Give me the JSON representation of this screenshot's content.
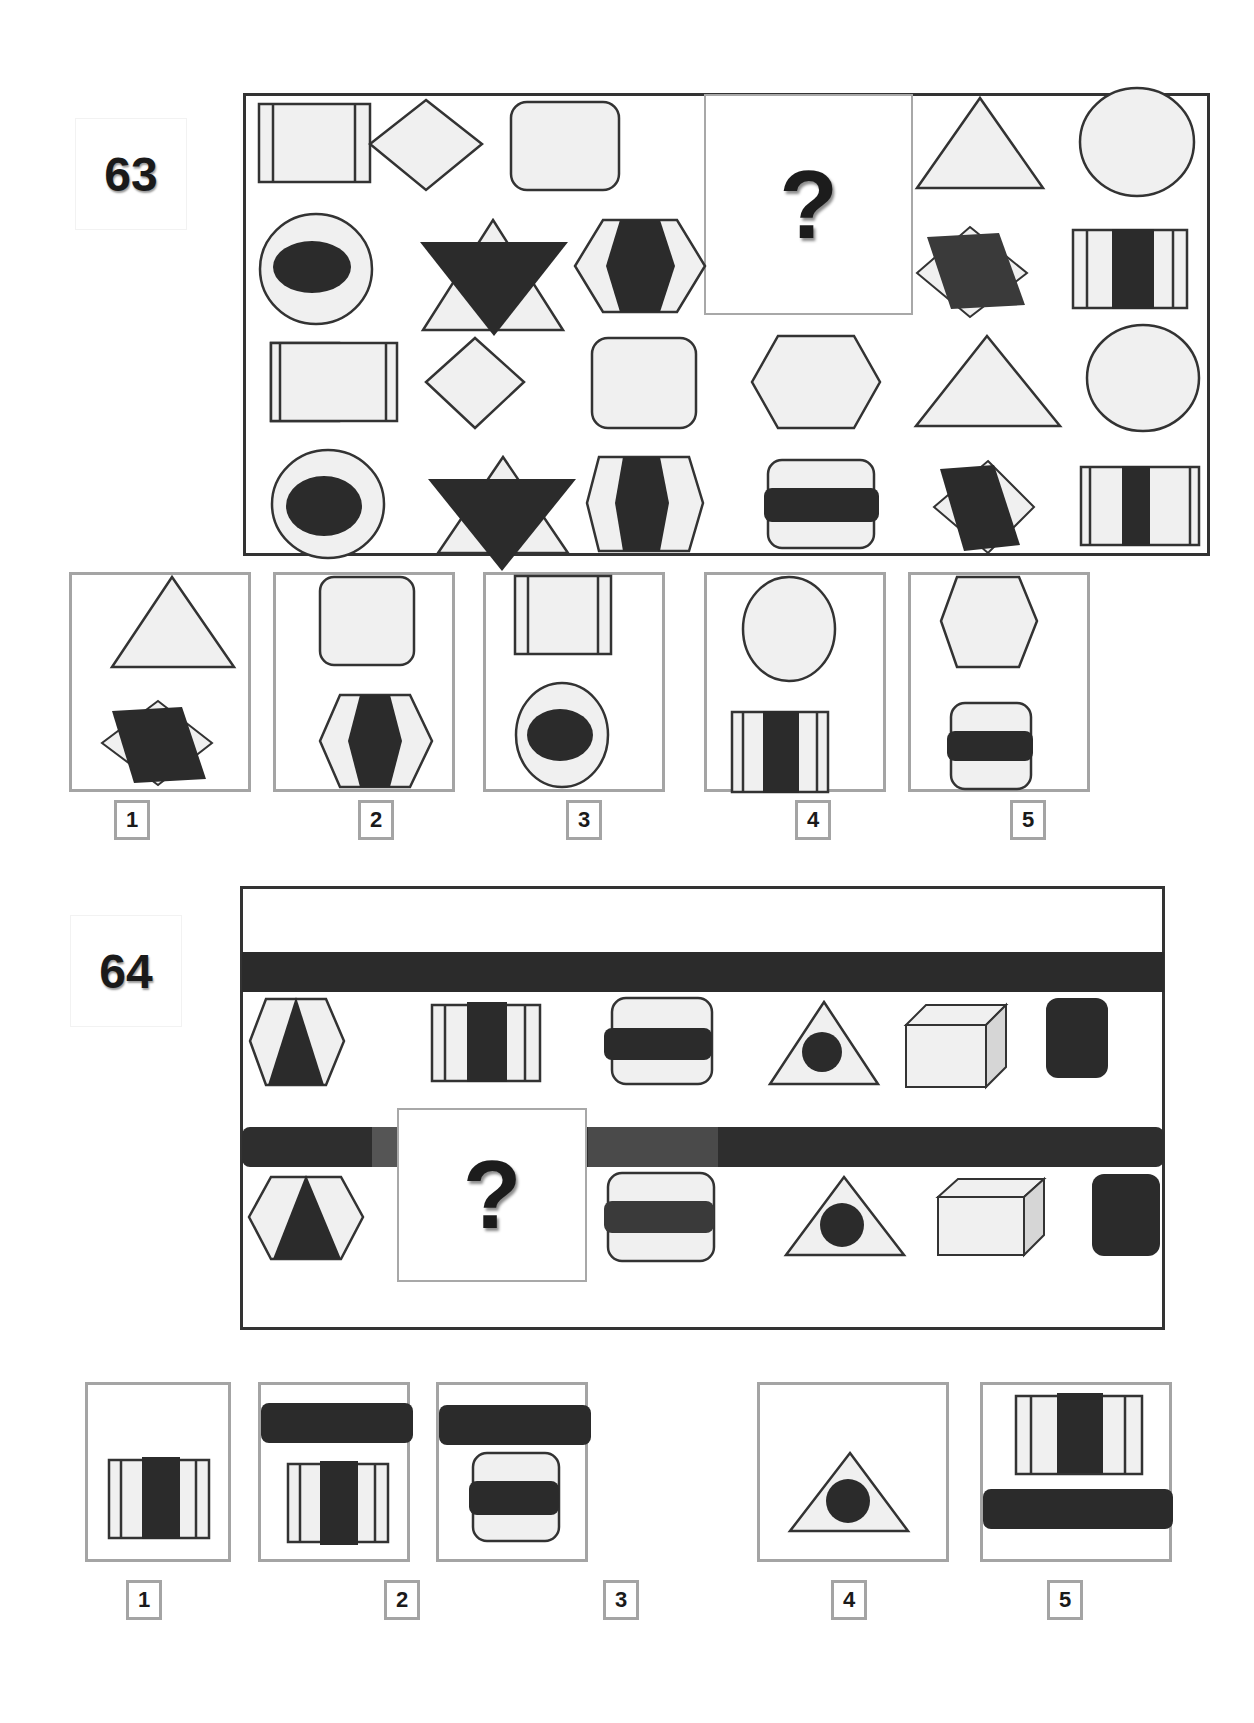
{
  "colors": {
    "stroke": "#333333",
    "fill_light": "#f0f0f0",
    "fill_dark": "#2b2b2b",
    "box_border": "#a4a4a4",
    "side_face": "#d6d6d6"
  },
  "puzzle63": {
    "number": "63",
    "question_mark": "?",
    "grid_rows": [
      [
        "striped-rectangle",
        "diamond",
        "rounded-square",
        "?",
        "triangle",
        "circle"
      ],
      [
        "circle-with-dark-oval",
        "star-of-david-dark-inverted",
        "hexagon-with-dark-band",
        "?",
        "diamond-with-dark-parallelogram",
        "barcode-rectangle"
      ],
      [
        "striped-rectangle",
        "diamond",
        "rounded-square",
        "hexagon",
        "triangle",
        "circle"
      ],
      [
        "circle-with-dark-oval",
        "star-of-david-dark-inverted",
        "hexagon-with-dark-band",
        "rounded-square-with-dark-bar",
        "diamond-with-dark-parallelogram",
        "barcode-rectangle"
      ]
    ],
    "options": [
      {
        "label": "1",
        "top": "triangle",
        "bottom": "diamond-with-dark-parallelogram"
      },
      {
        "label": "2",
        "top": "rounded-square",
        "bottom": "hexagon-with-dark-band"
      },
      {
        "label": "3",
        "top": "striped-rectangle",
        "bottom": "circle-with-dark-oval"
      },
      {
        "label": "4",
        "top": "circle",
        "bottom": "barcode-rectangle"
      },
      {
        "label": "5",
        "top": "hexagon",
        "bottom": "rounded-square-with-dark-bar"
      }
    ]
  },
  "puzzle64": {
    "number": "64",
    "question_mark": "?",
    "rows": [
      {
        "bar": "dark-horizontal-bar",
        "shapes": [
          "hexagon-with-dark-triangle",
          "barcode-rectangle",
          "rounded-square-with-dark-bar",
          "triangle-with-dark-circle",
          "3d-box",
          "dark-rounded-square"
        ]
      },
      {
        "bar": "dark-horizontal-bar",
        "shapes": [
          "hexagon-with-dark-triangle",
          "?",
          "rounded-square-with-dark-bar",
          "triangle-with-dark-circle",
          "3d-box",
          "dark-rounded-square"
        ]
      }
    ],
    "options": [
      {
        "label": "1",
        "content": [
          "barcode-rectangle"
        ]
      },
      {
        "label": "2",
        "content": [
          "dark-horizontal-bar",
          "barcode-rectangle"
        ]
      },
      {
        "label": "3",
        "content": [
          "dark-horizontal-bar",
          "rounded-square-with-dark-bar"
        ]
      },
      {
        "label": "4",
        "content": [
          "triangle-with-dark-circle"
        ]
      },
      {
        "label": "5",
        "content": [
          "barcode-rectangle",
          "dark-horizontal-bar"
        ]
      }
    ]
  }
}
